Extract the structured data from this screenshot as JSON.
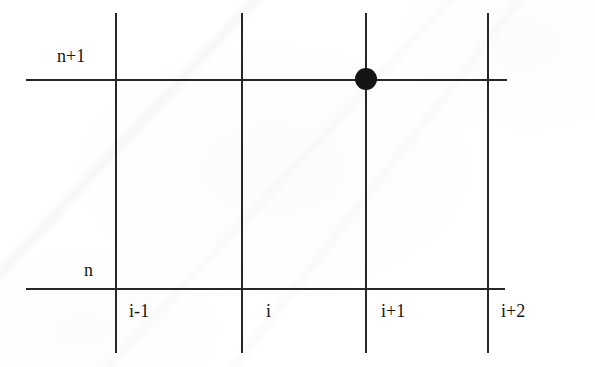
{
  "figure": {
    "width": 595,
    "height": 367,
    "background_color": "#ffffff",
    "line_color": "#272727",
    "marker_color": "#151515",
    "text_color": "#161616",
    "type": "finite-difference-grid-stencil"
  },
  "chart_data": {
    "type": "diagram",
    "title": "",
    "xlabel": "",
    "ylabel": "",
    "time_levels": [
      {
        "label": "n+1",
        "y": 79,
        "line_x_start": 26,
        "line_x_end": 507
      },
      {
        "label": "n",
        "y": 288,
        "line_x_start": 26,
        "line_x_end": 505
      }
    ],
    "space_nodes": [
      {
        "label": "i-1",
        "x": 115,
        "line_y_start": 13,
        "line_y_end": 353
      },
      {
        "label": "i",
        "x": 241,
        "line_y_start": 13,
        "line_y_end": 353
      },
      {
        "label": "i+1",
        "x": 365,
        "line_y_start": 13,
        "line_y_end": 353
      },
      {
        "label": "i+2",
        "x": 487,
        "line_y_start": 13,
        "line_y_end": 353
      }
    ],
    "markers": [
      {
        "label": "",
        "space": "i+1",
        "time": "n+1",
        "x": 366,
        "y": 79,
        "radius": 11,
        "style": "filled-circle"
      }
    ]
  },
  "labels": {
    "time_upper": "n+1",
    "time_lower": "n",
    "space_0": "i-1",
    "space_1": "i",
    "space_2": "i+1",
    "space_3": "i+2"
  },
  "label_positions": {
    "time_upper": {
      "left": 57,
      "top": 47
    },
    "time_lower": {
      "left": 84,
      "top": 261
    },
    "space_0": {
      "left": 129,
      "top": 302
    },
    "space_1": {
      "left": 266,
      "top": 302
    },
    "space_2": {
      "left": 381,
      "top": 302
    },
    "space_3": {
      "left": 501,
      "top": 302
    }
  }
}
